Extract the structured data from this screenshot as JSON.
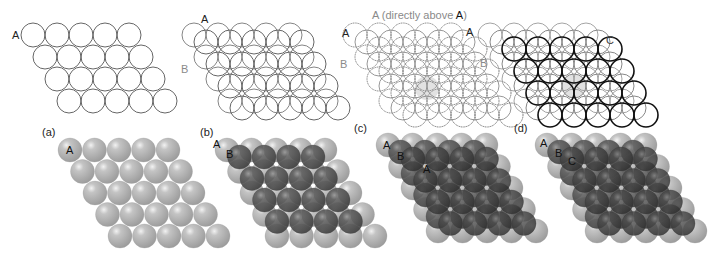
{
  "figure": {
    "panels": [
      {
        "id": "a",
        "label": "(a)",
        "layers": [
          "A"
        ],
        "outline_labels": [
          {
            "text": "A",
            "color": "#222222"
          }
        ],
        "sphere_labels": [
          "A"
        ]
      },
      {
        "id": "b",
        "label": "(b)",
        "layers": [
          "A",
          "B"
        ],
        "outline_labels": [
          {
            "text": "A",
            "color": "#222222"
          },
          {
            "text": "B",
            "color": "#8a8a8a"
          }
        ],
        "sphere_labels": [
          "A",
          "B"
        ]
      },
      {
        "id": "c",
        "label": "(c)",
        "layers": [
          "A",
          "B",
          "A"
        ],
        "caption_prefix": "A (directly above ",
        "caption_emph": "A",
        "caption_suffix": ")",
        "outline_labels": [
          {
            "text": "A",
            "color": "#222222"
          },
          {
            "text": "B",
            "color": "#8a8a8a"
          }
        ],
        "sphere_labels": [
          "A",
          "B",
          "A"
        ]
      },
      {
        "id": "d",
        "label": "(d)",
        "layers": [
          "A",
          "B",
          "C"
        ],
        "outline_labels": [
          {
            "text": "A",
            "color": "#222222"
          },
          {
            "text": "B",
            "color": "#8a8a8a"
          },
          {
            "text": "C",
            "color": "#444444"
          }
        ],
        "sphere_labels": [
          "A",
          "B",
          "C"
        ]
      }
    ],
    "colors": {
      "layer_A_outline": "#777777",
      "layer_B_outline": "#8c8c8c",
      "layer_C_outline": "#111111",
      "sphere_light": "#b8b8b8",
      "sphere_dark": "#5e5e5e",
      "highlight": "#e2e2e2"
    }
  }
}
